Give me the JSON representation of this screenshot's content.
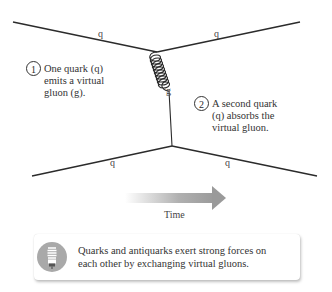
{
  "diagram": {
    "particles": {
      "top_left": "q",
      "top_right": "q",
      "bottom_left": "q",
      "bottom_right": "q",
      "gluon": "g"
    },
    "steps": [
      {
        "number": "1",
        "text_lines": [
          "One quark (q)",
          "emits a virtual",
          "gluon (g)."
        ]
      },
      {
        "number": "2",
        "text_lines": [
          "A second quark",
          "(q) absorbs the",
          "virtual gluon."
        ]
      }
    ],
    "time_arrow": {
      "label": "Time"
    },
    "callout": {
      "icon": "lightbulb-icon",
      "text_lines": [
        "Quarks and antiquarks exert strong forces on",
        "each other by exchanging virtual gluons."
      ]
    },
    "colors": {
      "line": "#2b2b2b",
      "arrow": "#9a9a9a",
      "icon_bg": "#a9a9a9"
    }
  }
}
